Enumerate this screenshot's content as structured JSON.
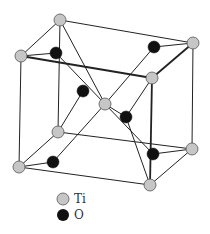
{
  "diagram": {
    "title": "",
    "type": "crystal-structure-unit-cell",
    "colors": {
      "ti_fill": "#c6c6c6",
      "ti_stroke": "#555555",
      "o_fill": "#111111",
      "bond": "#222222",
      "background": "#ffffff"
    },
    "atoms": [
      {
        "id": "ti-back-top-left",
        "element": "Ti",
        "x": 60,
        "y": 20
      },
      {
        "id": "ti-back-top-right",
        "element": "Ti",
        "x": 193,
        "y": 43
      },
      {
        "id": "ti-front-top-left",
        "element": "Ti",
        "x": 21,
        "y": 56
      },
      {
        "id": "ti-front-top-right",
        "element": "Ti",
        "x": 152,
        "y": 78
      },
      {
        "id": "ti-center",
        "element": "Ti",
        "x": 105,
        "y": 104
      },
      {
        "id": "ti-back-bottom-left",
        "element": "Ti",
        "x": 58,
        "y": 132
      },
      {
        "id": "ti-back-bottom-right",
        "element": "Ti",
        "x": 192,
        "y": 149
      },
      {
        "id": "ti-front-bottom-left",
        "element": "Ti",
        "x": 19,
        "y": 167
      },
      {
        "id": "ti-front-bottom-right",
        "element": "Ti",
        "x": 150,
        "y": 185
      },
      {
        "id": "o-top-left",
        "element": "O",
        "x": 56,
        "y": 53
      },
      {
        "id": "o-top-right",
        "element": "O",
        "x": 154,
        "y": 47
      },
      {
        "id": "o-upper-center",
        "element": "O",
        "x": 83,
        "y": 91
      },
      {
        "id": "o-lower-center",
        "element": "O",
        "x": 126,
        "y": 117
      },
      {
        "id": "o-bottom-left",
        "element": "O",
        "x": 53,
        "y": 162
      },
      {
        "id": "o-bottom-right",
        "element": "O",
        "x": 153,
        "y": 154
      }
    ],
    "bonds": [
      {
        "from": "ti-back-top-left",
        "to": "ti-back-top-right",
        "w": 1
      },
      {
        "from": "ti-back-top-left",
        "to": "ti-front-top-left",
        "w": 1
      },
      {
        "from": "ti-back-top-left",
        "to": "ti-back-bottom-left",
        "w": 1
      },
      {
        "from": "ti-back-top-left",
        "to": "ti-center",
        "w": 1
      },
      {
        "from": "ti-front-top-left",
        "to": "ti-front-top-right",
        "w": 1.8
      },
      {
        "from": "ti-front-top-left",
        "to": "ti-front-bottom-left",
        "w": 1
      },
      {
        "from": "ti-front-top-left",
        "to": "o-top-left",
        "w": 1
      },
      {
        "from": "o-top-left",
        "to": "ti-center",
        "w": 1
      },
      {
        "from": "ti-back-top-right",
        "to": "ti-front-top-right",
        "w": 1.8
      },
      {
        "from": "ti-back-top-right",
        "to": "ti-back-bottom-right",
        "w": 1
      },
      {
        "from": "ti-back-top-right",
        "to": "o-top-right",
        "w": 1
      },
      {
        "from": "o-top-right",
        "to": "ti-center",
        "w": 1
      },
      {
        "from": "ti-front-top-right",
        "to": "ti-front-bottom-right",
        "w": 1.8
      },
      {
        "from": "ti-front-top-right",
        "to": "o-lower-center",
        "w": 1
      },
      {
        "from": "o-upper-center",
        "to": "ti-back-bottom-left",
        "w": 1
      },
      {
        "from": "ti-center",
        "to": "o-lower-center",
        "w": 1
      },
      {
        "from": "ti-center",
        "to": "o-bottom-left",
        "w": 1
      },
      {
        "from": "ti-center",
        "to": "o-bottom-right",
        "w": 1
      },
      {
        "from": "o-lower-center",
        "to": "ti-front-bottom-right",
        "w": 1
      },
      {
        "from": "ti-back-bottom-left",
        "to": "ti-back-bottom-right",
        "w": 1
      },
      {
        "from": "ti-back-bottom-left",
        "to": "ti-front-bottom-left",
        "w": 1
      },
      {
        "from": "ti-front-bottom-left",
        "to": "o-bottom-left",
        "w": 1
      },
      {
        "from": "ti-front-bottom-left",
        "to": "ti-front-bottom-right",
        "w": 1
      },
      {
        "from": "ti-front-bottom-right",
        "to": "ti-back-bottom-right",
        "w": 1
      },
      {
        "from": "o-bottom-right",
        "to": "ti-back-bottom-right",
        "w": 1
      }
    ]
  },
  "legend": {
    "items": [
      {
        "label": "Ti",
        "swatch": "ti",
        "x": 63,
        "y": 199
      },
      {
        "label": "O",
        "swatch": "o",
        "x": 63,
        "y": 215
      }
    ]
  }
}
